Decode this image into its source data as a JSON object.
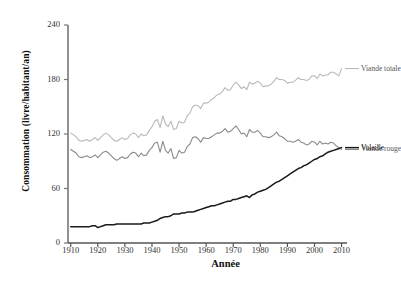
{
  "chart_data": {
    "type": "line",
    "title": "",
    "xlabel": "Année",
    "ylabel": "Consommation (livre/habitant/an)",
    "xlim": [
      1909,
      2012
    ],
    "ylim": [
      0,
      240
    ],
    "yticks": [
      0,
      60,
      120,
      180,
      240
    ],
    "xticks": [
      1910,
      1920,
      1930,
      1940,
      1950,
      1960,
      1970,
      1980,
      1990,
      2000,
      2010
    ],
    "grid": false,
    "legend_position": "right-inline",
    "x": [
      1910,
      1911,
      1912,
      1913,
      1914,
      1915,
      1916,
      1917,
      1918,
      1919,
      1920,
      1921,
      1922,
      1923,
      1924,
      1925,
      1926,
      1927,
      1928,
      1929,
      1930,
      1931,
      1932,
      1933,
      1934,
      1935,
      1936,
      1937,
      1938,
      1939,
      1940,
      1941,
      1942,
      1943,
      1944,
      1945,
      1946,
      1947,
      1948,
      1949,
      1950,
      1951,
      1952,
      1953,
      1954,
      1955,
      1956,
      1957,
      1958,
      1959,
      1960,
      1961,
      1962,
      1963,
      1964,
      1965,
      1966,
      1967,
      1968,
      1969,
      1970,
      1971,
      1972,
      1973,
      1974,
      1975,
      1976,
      1977,
      1978,
      1979,
      1980,
      1981,
      1982,
      1983,
      1984,
      1985,
      1986,
      1987,
      1988,
      1989,
      1990,
      1991,
      1992,
      1993,
      1994,
      1995,
      1996,
      1997,
      1998,
      1999,
      2000,
      2001,
      2002,
      2003,
      2004,
      2005,
      2006,
      2007,
      2008,
      2009,
      2010
    ],
    "series": [
      {
        "name": "Viande totale",
        "color": "#b9b9b9",
        "label_color": "#555555",
        "values": [
          121,
          119,
          117,
          113,
          112,
          113,
          114,
          112,
          114,
          116,
          113,
          116,
          119,
          121,
          119,
          116,
          113,
          112,
          114,
          116,
          114,
          115,
          119,
          121,
          120,
          116,
          120,
          118,
          119,
          124,
          128,
          134,
          136,
          127,
          140,
          131,
          128,
          134,
          125,
          126,
          134,
          132,
          133,
          140,
          143,
          150,
          152,
          151,
          148,
          154,
          154,
          155,
          158,
          160,
          163,
          164,
          167,
          171,
          168,
          169,
          174,
          177,
          174,
          170,
          172,
          169,
          177,
          175,
          176,
          178,
          176,
          172,
          173,
          173,
          175,
          178,
          182,
          180,
          180,
          179,
          176,
          177,
          177,
          179,
          182,
          180,
          180,
          179,
          180,
          184,
          184,
          181,
          186,
          184,
          185,
          185,
          188,
          188,
          186,
          184,
          192
        ]
      },
      {
        "name": "Viande rouge",
        "color": "#8a8a8a",
        "label_color": "#555555",
        "values": [
          103,
          101,
          99,
          95,
          94,
          95,
          96,
          94,
          95,
          97,
          94,
          97,
          100,
          101,
          99,
          96,
          93,
          91,
          93,
          95,
          93,
          94,
          98,
          100,
          99,
          95,
          99,
          96,
          97,
          102,
          105,
          110,
          111,
          100,
          112,
          102,
          99,
          104,
          93,
          94,
          102,
          99,
          100,
          106,
          109,
          116,
          117,
          115,
          111,
          116,
          115,
          115,
          117,
          119,
          121,
          121,
          123,
          126,
          122,
          123,
          126,
          129,
          125,
          120,
          121,
          117,
          125,
          122,
          122,
          124,
          121,
          117,
          117,
          116,
          117,
          119,
          122,
          118,
          117,
          115,
          112,
          112,
          111,
          112,
          114,
          111,
          110,
          108,
          109,
          112,
          111,
          108,
          112,
          109,
          110,
          109,
          111,
          110,
          107,
          105,
          103
        ]
      },
      {
        "name": "Volaille",
        "color": "#1a1a1a",
        "label_color": "#222222",
        "values": [
          18,
          18,
          18,
          18,
          18,
          18,
          18,
          18,
          19,
          19,
          17,
          18,
          19,
          20,
          20,
          20,
          20,
          21,
          21,
          21,
          21,
          21,
          21,
          21,
          21,
          21,
          21,
          22,
          22,
          22,
          23,
          24,
          25,
          27,
          28,
          29,
          29,
          30,
          32,
          32,
          32,
          33,
          33,
          34,
          34,
          34,
          35,
          36,
          37,
          38,
          39,
          40,
          41,
          41,
          42,
          43,
          44,
          45,
          46,
          46,
          48,
          48,
          49,
          50,
          51,
          52,
          50,
          53,
          54,
          56,
          57,
          58,
          59,
          61,
          63,
          65,
          67,
          68,
          70,
          72,
          74,
          76,
          78,
          80,
          82,
          83,
          85,
          86,
          88,
          90,
          92,
          93,
          95,
          96,
          98,
          100,
          101,
          102,
          103,
          104,
          105
        ]
      }
    ],
    "series_display_max": {
      "Viande totale": 192,
      "Viande rouge": 103,
      "Volaille": 65
    }
  },
  "legend": {
    "items": [
      {
        "label": "Viande totale"
      },
      {
        "label": "Viande rouge"
      },
      {
        "label": "Volaille"
      }
    ]
  },
  "axes": {
    "y_title": "Consommation (livre/habitant/an)",
    "x_title": "Année",
    "y_tick_labels": [
      "0",
      "60",
      "120",
      "180",
      "240"
    ],
    "x_tick_labels": [
      "1910",
      "1920",
      "1930",
      "1940",
      "1950",
      "1960",
      "1970",
      "1980",
      "1990",
      "2000",
      "2010"
    ]
  }
}
